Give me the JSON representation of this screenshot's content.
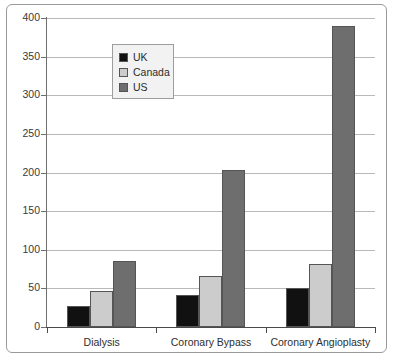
{
  "chart_data": {
    "type": "bar",
    "title": "",
    "subtitle": "",
    "xlabel": "",
    "ylabel": "",
    "categories": [
      "Dialysis",
      "Coronary Bypass",
      "Coronary Angioplasty"
    ],
    "series": [
      {
        "name": "UK",
        "color": "#111111",
        "values": [
          27,
          42,
          51
        ]
      },
      {
        "name": "Canada",
        "color": "#cccccc",
        "values": [
          47,
          66,
          81
        ]
      },
      {
        "name": "US",
        "color": "#6e6e6e",
        "values": [
          86,
          203,
          389
        ]
      }
    ],
    "ylim": [
      0,
      400
    ],
    "ytick_values": [
      0,
      50,
      100,
      150,
      200,
      250,
      300,
      350,
      400
    ],
    "ytick_labels": [
      "0",
      "50",
      "100",
      "150",
      "200",
      "250",
      "300",
      "350",
      "400"
    ],
    "grid": true,
    "grid_axis": "y",
    "legend_position": "upper left",
    "bar_outline_color": "#555555",
    "frame_color": "#9a9a9a",
    "background_color": "#ffffff"
  },
  "legend": {
    "entries": [
      {
        "label": "UK",
        "color": "#111111"
      },
      {
        "label": "Canada",
        "color": "#cccccc"
      },
      {
        "label": "US",
        "color": "#6e6e6e"
      }
    ]
  }
}
